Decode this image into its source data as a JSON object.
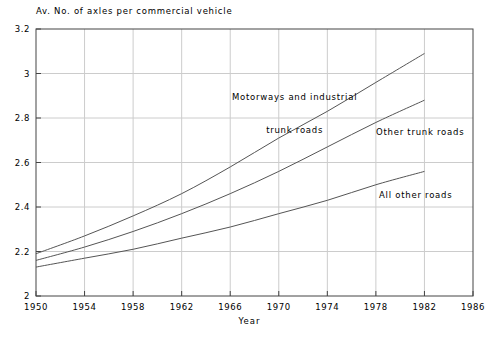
{
  "chart_data": {
    "type": "line",
    "title": "",
    "ylabel": "Av. No. of axles per commercial vehicle",
    "xlabel": "Year",
    "xlim": [
      1950,
      1986
    ],
    "ylim": [
      2,
      3.2
    ],
    "xticks": [
      "1950",
      "1954",
      "1958",
      "1962",
      "1966",
      "1970",
      "1974",
      "1978",
      "1982",
      "1986"
    ],
    "yticks": [
      "2",
      "2.2",
      "2.4",
      "2.6",
      "2.8",
      "3",
      "3.2"
    ],
    "grid": true,
    "legend_position": "inline-annotations",
    "x": [
      1950,
      1954,
      1958,
      1962,
      1966,
      1970,
      1974,
      1978,
      1982
    ],
    "series": [
      {
        "name": "Motorways and industrial trunk roads",
        "label_line1": "Motorways and industrial",
        "label_line2": "trunk roads",
        "values": [
          2.19,
          2.27,
          2.36,
          2.46,
          2.58,
          2.71,
          2.83,
          2.96,
          3.09
        ]
      },
      {
        "name": "Other trunk roads",
        "label_line1": "Other trunk roads",
        "label_line2": "",
        "values": [
          2.16,
          2.22,
          2.29,
          2.37,
          2.46,
          2.56,
          2.67,
          2.78,
          2.88
        ]
      },
      {
        "name": "All other roads",
        "label_line1": "All other roads",
        "label_line2": "",
        "values": [
          2.13,
          2.17,
          2.21,
          2.26,
          2.31,
          2.37,
          2.43,
          2.5,
          2.56
        ]
      }
    ],
    "colors": {
      "line": "#555555",
      "axis": "#444444",
      "grid": "#cccccc",
      "text": "#000000"
    }
  },
  "ytick_labels": [
    "3.2",
    "3",
    "2.8",
    "2.6",
    "2.4",
    "2.2",
    "2"
  ],
  "xtick_labels": [
    "1950",
    "1954",
    "1958",
    "1962",
    "1966",
    "1970",
    "1974",
    "1978",
    "1982",
    "1986"
  ],
  "annotations": {
    "motorways_line1": "Motorways and industrial",
    "motorways_line2": "trunk roads",
    "other_trunk": "Other trunk roads",
    "all_other": "All other roads"
  },
  "labels": {
    "y_axis_title": "Av. No. of axles per commercial vehicle",
    "x_axis_title": "Year"
  }
}
